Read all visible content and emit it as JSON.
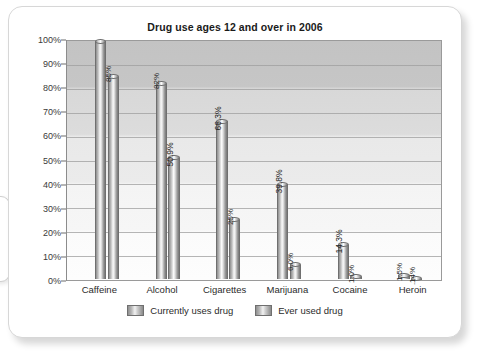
{
  "card": {
    "title": "Drug use ages 12 and over in 2006"
  },
  "chart_data": {
    "type": "bar",
    "title": "Drug use ages 12 and over in 2006",
    "xlabel": "",
    "ylabel": "",
    "ylim": [
      0,
      100
    ],
    "ytick_labels": [
      "100%",
      "90%",
      "80%",
      "70%",
      "60%",
      "50%",
      "40%",
      "30%",
      "20%",
      "10%",
      "0%"
    ],
    "ytick_values": [
      100,
      90,
      80,
      70,
      60,
      50,
      40,
      30,
      20,
      10,
      0
    ],
    "grid": true,
    "legend_position": "bottom",
    "categories": [
      "Caffeine",
      "Alcohol",
      "Cigarettes",
      "Marijuana",
      "Cocaine",
      "Heroin"
    ],
    "series": [
      {
        "name": "Currently uses drug",
        "values": [
          100,
          82,
          66.3,
          39.8,
          14.3,
          1.5
        ],
        "labels": [
          "",
          "82%",
          "66.3%",
          "39.8%",
          "14.3%",
          "1.5%"
        ]
      },
      {
        "name": "Ever used drug",
        "values": [
          85,
          50.9,
          25,
          6.0,
          1.0,
          0.14
        ],
        "labels": [
          "85%",
          "50.9%",
          "25%",
          "6.0%",
          "1.0%",
          ".14%"
        ]
      }
    ]
  },
  "legend": {
    "items": [
      {
        "label": "Currently uses drug"
      },
      {
        "label": "Ever used drug"
      }
    ]
  }
}
